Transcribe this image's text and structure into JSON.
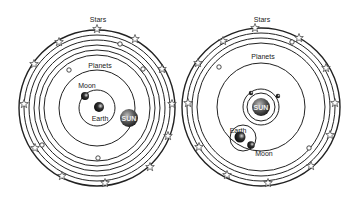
{
  "diagrams": [
    {
      "model": "geocentric",
      "labels": {
        "stars": "Stars",
        "planets": "Planets",
        "moon": "Moon",
        "earth": "Earth",
        "sun": "SUN"
      }
    },
    {
      "model": "heliocentric",
      "labels": {
        "stars": "Stars",
        "planets": "Planets",
        "moon": "Moon",
        "earth": "Earth",
        "sun": "SUN"
      }
    }
  ],
  "colors": {
    "line": "#222222",
    "sun": "#555555",
    "background": "#ffffff"
  }
}
